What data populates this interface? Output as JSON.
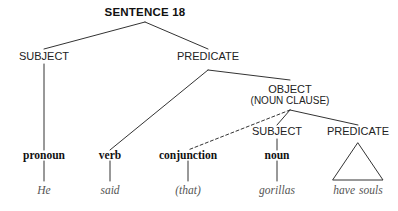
{
  "diagram": {
    "title": "SENTENCE 18",
    "accent_color": "#333333",
    "word_color": "#555555",
    "background_color": "#ffffff",
    "nodes": {
      "root": "SENTENCE 18",
      "subject_top": "SUBJECT",
      "predicate_top": "PREDICATE",
      "object": "OBJECT",
      "object_sub": "(NOUN CLAUSE)",
      "subject_inner": "SUBJECT",
      "predicate_inner": "PREDICATE",
      "pos_pronoun": "pronoun",
      "pos_verb": "verb",
      "pos_conjunction": "conjunction",
      "pos_noun": "noun",
      "word_he": "He",
      "word_said": "said",
      "word_that": "(that)",
      "word_gorillas": "gorillas",
      "word_have": "have",
      "word_souls": "souls"
    }
  }
}
